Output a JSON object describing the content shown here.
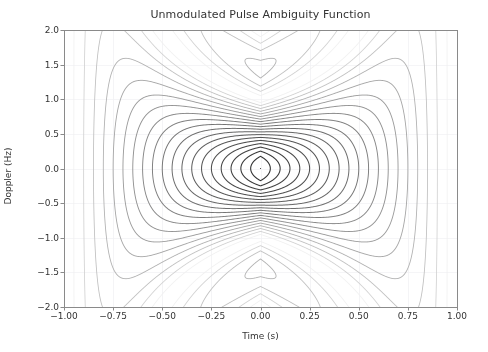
{
  "figure": {
    "width": 488,
    "height": 352,
    "background": "#ffffff",
    "axes_background": "#ffffff"
  },
  "chart_data": {
    "type": "contour",
    "title": "Unmodulated Pulse Ambiguity Function",
    "xlabel": "Time (s)",
    "ylabel": "Doppler (Hz)",
    "xlim": [
      -1.0,
      1.0
    ],
    "ylim": [
      -2.0,
      2.0
    ],
    "xticks": [
      -1.0,
      -0.75,
      -0.5,
      -0.25,
      0.0,
      0.25,
      0.5,
      0.75,
      1.0
    ],
    "xticklabels": [
      "−1.00",
      "−0.75",
      "−0.50",
      "−0.25",
      "0.00",
      "0.25",
      "0.50",
      "0.75",
      "1.00"
    ],
    "yticks": [
      -2.0,
      -1.5,
      -1.0,
      -0.5,
      0.0,
      0.5,
      1.0,
      1.5,
      2.0
    ],
    "yticklabels": [
      "−2.0",
      "−1.5",
      "−1.0",
      "−0.5",
      "0.0",
      "0.5",
      "1.0",
      "1.5",
      "2.0"
    ],
    "grid": true,
    "grid_color": "#f2f2f4",
    "legend": null,
    "function": "abs((1-abs(t)/T)*sinc(nu*T*(1-abs(t)/T)))",
    "pulse_width_T": 1.0,
    "n_levels": 20,
    "levels": [
      0.05,
      0.1,
      0.15,
      0.2,
      0.25,
      0.3,
      0.35,
      0.4,
      0.45,
      0.5,
      0.55,
      0.6,
      0.65,
      0.7,
      0.75,
      0.8,
      0.85,
      0.9,
      0.95,
      1.0
    ],
    "colormap": "greys",
    "level_color_low": "#f0f0f0",
    "level_color_high": "#2b2b2b",
    "peak_value": 1.0,
    "peak_location": [
      0.0,
      0.0
    ],
    "plot_box": {
      "left": 64,
      "top": 30,
      "right": 457,
      "bottom": 307
    }
  },
  "style": {
    "spine_color": "#8a8a8a",
    "tick_color": "#8a8a8a",
    "text_color": "#333333",
    "title_fontsize": 11,
    "label_fontsize": 9,
    "tick_fontsize": 9
  }
}
